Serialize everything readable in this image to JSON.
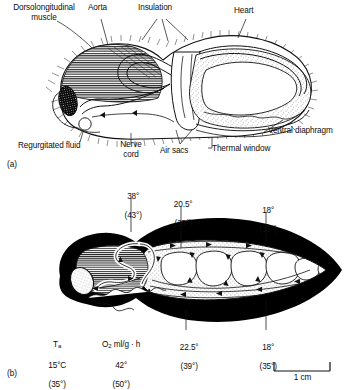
{
  "figure": {
    "panel_a": {
      "mark": "(a)",
      "labels": [
        {
          "id": "dorsolongitudinal-muscle",
          "text": "Dorsolongitudinal\nmuscle"
        },
        {
          "id": "aorta",
          "text": "Aorta"
        },
        {
          "id": "insulation",
          "text": "Insulation"
        },
        {
          "id": "heart",
          "text": "Heart"
        },
        {
          "id": "ventral-diaphragm",
          "text": "Ventral diaphragm"
        },
        {
          "id": "thermal-window",
          "text": "Thermal window"
        },
        {
          "id": "air-sacs",
          "text": "Air sacs"
        },
        {
          "id": "nerve-cord",
          "text": "Nerve\ncord"
        },
        {
          "id": "regurgitated-fluid",
          "text": "Regurgitated fluid"
        }
      ]
    },
    "panel_b": {
      "mark": "(b)",
      "temperature_labels": [
        {
          "id": "thorax-temp",
          "value": "38°",
          "alt": "(43°)"
        },
        {
          "id": "petiole-temp",
          "value": "20.5°",
          "alt": "(35°)"
        },
        {
          "id": "upper-abdomen-temp",
          "value": "18°",
          "alt": "(35°)"
        },
        {
          "id": "lower-abdomen-temp",
          "value": "22.5°",
          "alt": "(39°)"
        },
        {
          "id": "posterior-abdomen-temp",
          "value": "18°",
          "alt": "(35°)"
        }
      ],
      "legend": {
        "ambient": {
          "symbol_main": "T",
          "symbol_sub": "a",
          "value": "15°C",
          "alt": "(35°)"
        },
        "oxygen": {
          "symbol_main": "O",
          "symbol_sub": "2",
          "symbol_rest": " ml/g · h",
          "value": "42°",
          "alt": "(50°)"
        }
      },
      "scale_bar": {
        "label": "1 cm"
      }
    }
  },
  "colors": {
    "ink": "#0d0d0d",
    "background": "#ffffff",
    "insulation_fill": "#000000",
    "stipple": "#6b6b6b",
    "muscle_hatch": "#2a2a2a"
  }
}
